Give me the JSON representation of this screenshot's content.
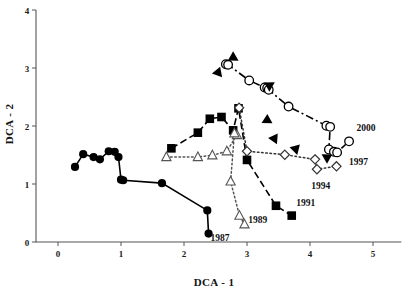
{
  "chart_data": {
    "type": "scatter",
    "title": "",
    "xlabel": "DCA - 1",
    "ylabel": "DCA - 2",
    "xlim": [
      -0.25,
      5.4
    ],
    "ylim": [
      -0.2,
      4.15
    ],
    "xticks": [
      0,
      1,
      2,
      3,
      4,
      5
    ],
    "yticks": [
      0,
      1,
      2,
      3,
      4
    ],
    "xtick_labels": [
      "0",
      "1",
      "2",
      "3",
      "4",
      "5"
    ],
    "ytick_labels": [
      "0",
      "1",
      "2",
      "3",
      "4"
    ],
    "grid": false,
    "legend": "none",
    "annotations": [
      {
        "text": "1987",
        "x": 2.42,
        "y": 0.02
      },
      {
        "text": "1989",
        "x": 3.02,
        "y": 0.33
      },
      {
        "text": "1991",
        "x": 3.78,
        "y": 0.62
      },
      {
        "text": "1994",
        "x": 4.02,
        "y": 0.92
      },
      {
        "text": "1997",
        "x": 4.62,
        "y": 1.33
      },
      {
        "text": "2000",
        "x": 4.74,
        "y": 1.92
      }
    ],
    "series": [
      {
        "name": "filled-circle-trajectory",
        "marker": "filled-circle",
        "line": "solid",
        "color": "#000000",
        "points": [
          {
            "x": 0.27,
            "y": 1.295
          },
          {
            "x": 0.4,
            "y": 1.515
          },
          {
            "x": 0.565,
            "y": 1.465
          },
          {
            "x": 0.665,
            "y": 1.425
          },
          {
            "x": 0.805,
            "y": 1.565
          },
          {
            "x": 0.9,
            "y": 1.555
          },
          {
            "x": 0.96,
            "y": 1.465
          },
          {
            "x": 1.0,
            "y": 1.075
          },
          {
            "x": 1.035,
            "y": 1.065
          },
          {
            "x": 1.65,
            "y": 1.015
          },
          {
            "x": 2.37,
            "y": 0.545
          },
          {
            "x": 2.39,
            "y": 0.145
          }
        ]
      },
      {
        "name": "filled-square-trajectory",
        "marker": "filled-square",
        "line": "dashed",
        "color": "#000000",
        "points": [
          {
            "x": 1.8,
            "y": 1.615
          },
          {
            "x": 2.22,
            "y": 1.885
          },
          {
            "x": 2.41,
            "y": 2.125
          },
          {
            "x": 2.595,
            "y": 2.155
          },
          {
            "x": 2.78,
            "y": 1.925
          },
          {
            "x": 2.865,
            "y": 2.305
          },
          {
            "x": 3.0,
            "y": 1.415
          },
          {
            "x": 3.46,
            "y": 0.625
          },
          {
            "x": 3.71,
            "y": 0.455
          }
        ]
      },
      {
        "name": "open-triangle-trajectory",
        "marker": "open-triangle",
        "line": "dotted",
        "color": "#555555",
        "points": [
          {
            "x": 1.72,
            "y": 1.465
          },
          {
            "x": 2.22,
            "y": 1.465
          },
          {
            "x": 2.45,
            "y": 1.495
          },
          {
            "x": 2.68,
            "y": 1.565
          },
          {
            "x": 2.84,
            "y": 1.845
          },
          {
            "x": 2.8,
            "y": 1.875
          },
          {
            "x": 2.74,
            "y": 1.045
          },
          {
            "x": 2.88,
            "y": 0.455
          },
          {
            "x": 2.96,
            "y": 0.305
          }
        ]
      },
      {
        "name": "open-circle-trajectory",
        "marker": "open-circle",
        "line": "dashdot",
        "color": "#000000",
        "points": [
          {
            "x": 2.665,
            "y": 3.065
          },
          {
            "x": 2.7,
            "y": 3.055
          },
          {
            "x": 3.035,
            "y": 2.785
          },
          {
            "x": 3.28,
            "y": 2.665
          },
          {
            "x": 3.32,
            "y": 2.655
          },
          {
            "x": 3.345,
            "y": 2.625
          },
          {
            "x": 3.66,
            "y": 2.335
          },
          {
            "x": 4.26,
            "y": 2.005
          },
          {
            "x": 4.32,
            "y": 1.985
          },
          {
            "x": 4.3,
            "y": 1.595
          },
          {
            "x": 4.38,
            "y": 1.555
          },
          {
            "x": 4.43,
            "y": 1.545
          },
          {
            "x": 4.62,
            "y": 1.735
          }
        ]
      },
      {
        "name": "open-diamond-trajectory",
        "marker": "open-diamond",
        "line": "dotted",
        "color": "#333333",
        "points": [
          {
            "x": 2.875,
            "y": 2.315
          },
          {
            "x": 3.0,
            "y": 1.565
          },
          {
            "x": 3.6,
            "y": 1.505
          },
          {
            "x": 4.08,
            "y": 1.425
          },
          {
            "x": 4.11,
            "y": 1.255
          },
          {
            "x": 4.42,
            "y": 1.305
          }
        ]
      },
      {
        "name": "arrowheads",
        "marker": "filled-triangle-down",
        "line": "none",
        "color": "#000000",
        "points": [
          {
            "x": 2.545,
            "y": 2.935,
            "angle": 200
          },
          {
            "x": 2.77,
            "y": 3.175,
            "angle": 60
          },
          {
            "x": 3.345,
            "y": 2.705,
            "angle": 120
          },
          {
            "x": 3.32,
            "y": 2.115,
            "angle": 182
          },
          {
            "x": 3.44,
            "y": 1.795,
            "angle": 215
          },
          {
            "x": 3.78,
            "y": 1.615,
            "angle": 225
          },
          {
            "x": 4.28,
            "y": 1.465,
            "angle": 240
          }
        ]
      }
    ]
  }
}
